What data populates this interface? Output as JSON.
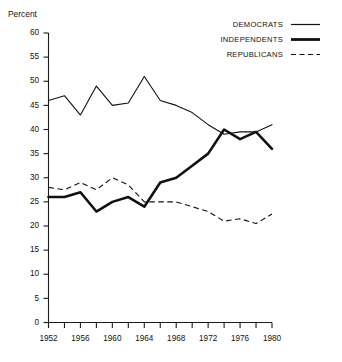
{
  "chart_data": {
    "type": "line",
    "title": "",
    "xlabel": "",
    "ylabel": "Percent",
    "ylim": [
      0,
      60
    ],
    "xlim": [
      1952,
      1980
    ],
    "grid": false,
    "legend_position": "top-right",
    "x": [
      1952,
      1954,
      1956,
      1958,
      1960,
      1962,
      1964,
      1966,
      1968,
      1970,
      1972,
      1974,
      1976,
      1978,
      1980
    ],
    "y_ticks": [
      0,
      5,
      10,
      15,
      20,
      25,
      30,
      35,
      40,
      45,
      50,
      55,
      60
    ],
    "x_ticks_major": [
      1952,
      1956,
      1960,
      1964,
      1968,
      1972,
      1976,
      1980
    ],
    "x_ticks_minor": [
      1954,
      1958,
      1962,
      1966,
      1970,
      1974,
      1978
    ],
    "series": [
      {
        "name": "DEMOCRATS",
        "style": "solid-thin",
        "values": [
          46,
          47,
          43,
          49,
          45,
          45.5,
          51,
          46,
          45,
          43.5,
          41,
          39,
          39.5,
          39.5,
          41
        ]
      },
      {
        "name": "INDEPENDENTS",
        "style": "solid-thick",
        "values": [
          26,
          26,
          27,
          23,
          25,
          26,
          24,
          29,
          30,
          32.5,
          35,
          40,
          38,
          39.5,
          36
        ]
      },
      {
        "name": "REPUBLICANS",
        "style": "dashed",
        "values": [
          28,
          27.5,
          29,
          27.5,
          30,
          28.5,
          25,
          25,
          25,
          24,
          23,
          21,
          21.5,
          20.5,
          22.5
        ]
      }
    ]
  },
  "axis": {
    "y_title": "Percent",
    "y_tick_labels": [
      "0",
      "5",
      "10",
      "15",
      "20",
      "25",
      "30",
      "35",
      "40",
      "45",
      "50",
      "55",
      "60"
    ],
    "x_tick_labels": [
      "1952",
      "1956",
      "1960",
      "1964",
      "1968",
      "1972",
      "1976",
      "1980"
    ]
  },
  "legend": {
    "items": [
      {
        "label": "DEMOCRATS",
        "style": "solid-thin"
      },
      {
        "label": "INDEPENDENTS",
        "style": "solid-thick"
      },
      {
        "label": "REPUBLICANS",
        "style": "dashed"
      }
    ]
  }
}
